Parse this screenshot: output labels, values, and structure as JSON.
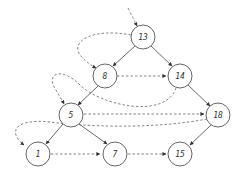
{
  "diagram": {
    "type": "threaded-binary-tree",
    "nodes": [
      {
        "id": "n13",
        "label": "13",
        "x": 143,
        "y": 37
      },
      {
        "id": "n8",
        "label": "8",
        "x": 105,
        "y": 76
      },
      {
        "id": "n14",
        "label": "14",
        "x": 180,
        "y": 76
      },
      {
        "id": "n5",
        "label": "5",
        "x": 71,
        "y": 115
      },
      {
        "id": "n18",
        "label": "18",
        "x": 218,
        "y": 115
      },
      {
        "id": "n1",
        "label": "1",
        "x": 38,
        "y": 154
      },
      {
        "id": "n7",
        "label": "7",
        "x": 115,
        "y": 154
      },
      {
        "id": "n15",
        "label": "15",
        "x": 180,
        "y": 154
      }
    ],
    "solid_edges": [
      {
        "from": "13",
        "to": "8"
      },
      {
        "from": "13",
        "to": "14"
      },
      {
        "from": "8",
        "to": "5"
      },
      {
        "from": "14",
        "to": "18"
      },
      {
        "from": "5",
        "to": "1"
      },
      {
        "from": "5",
        "to": "7"
      },
      {
        "from": "18",
        "to": "15"
      }
    ],
    "dashed_edges": [
      {
        "from": "root-entry",
        "to": "13"
      },
      {
        "from": "13",
        "to": "8"
      },
      {
        "from": "8",
        "to": "14"
      },
      {
        "from": "14",
        "to": "5"
      },
      {
        "from": "5",
        "to": "18"
      },
      {
        "from": "18",
        "to": "1"
      },
      {
        "from": "1",
        "to": "7"
      },
      {
        "from": "7",
        "to": "15"
      }
    ]
  }
}
